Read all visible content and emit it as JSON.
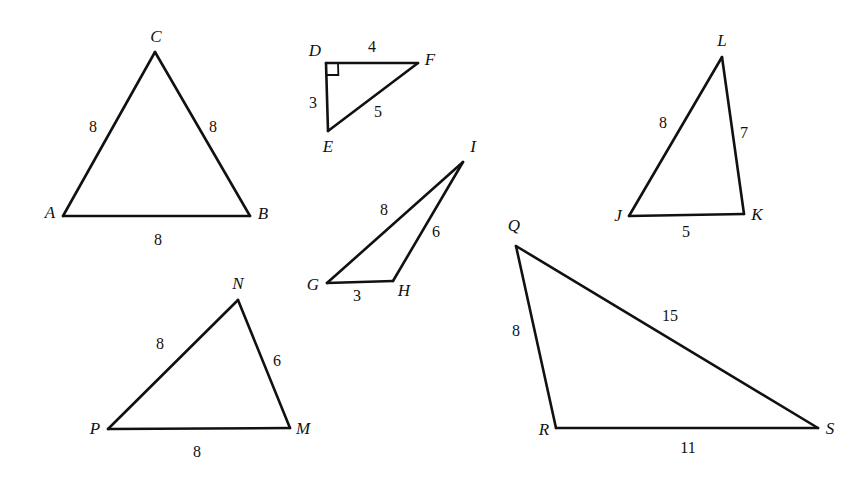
{
  "figure": {
    "width": 867,
    "height": 482,
    "background_color": "#ffffff",
    "line_color": "#111111"
  },
  "chart_data": {
    "type": "diagram",
    "title": "",
    "shapes": [
      {
        "id": "triangle-abc",
        "name": "Triangle ABC",
        "vertices": [
          {
            "label": "A",
            "x": 63,
            "y": 216,
            "label_x": 50,
            "label_y": 214
          },
          {
            "label": "B",
            "x": 250,
            "y": 216,
            "label_x": 263,
            "label_y": 215
          },
          {
            "label": "C",
            "x": 155,
            "y": 52,
            "label_x": 156,
            "label_y": 38
          }
        ],
        "sides": [
          {
            "from": "A",
            "to": "C",
            "value": "8",
            "label_x": 93,
            "label_y": 128
          },
          {
            "from": "C",
            "to": "B",
            "value": "8",
            "label_x": 213,
            "label_y": 128
          },
          {
            "from": "A",
            "to": "B",
            "value": "8",
            "label_x": 158,
            "label_y": 241
          }
        ],
        "right_angle_at": null
      },
      {
        "id": "triangle-def",
        "name": "Triangle DEF",
        "vertices": [
          {
            "label": "D",
            "x": 326,
            "y": 63,
            "label_x": 315,
            "label_y": 52
          },
          {
            "label": "E",
            "x": 328,
            "y": 131,
            "label_x": 328,
            "label_y": 148
          },
          {
            "label": "F",
            "x": 418,
            "y": 63,
            "label_x": 430,
            "label_y": 61
          }
        ],
        "sides": [
          {
            "from": "D",
            "to": "F",
            "value": "4",
            "label_x": 372,
            "label_y": 48
          },
          {
            "from": "D",
            "to": "E",
            "value": "3",
            "label_x": 313,
            "label_y": 104
          },
          {
            "from": "E",
            "to": "F",
            "value": "5",
            "label_x": 378,
            "label_y": 113
          }
        ],
        "right_angle_at": "D"
      },
      {
        "id": "triangle-ghi",
        "name": "Triangle GHI",
        "vertices": [
          {
            "label": "G",
            "x": 327,
            "y": 283,
            "label_x": 313,
            "label_y": 286
          },
          {
            "label": "H",
            "x": 393,
            "y": 281,
            "label_x": 404,
            "label_y": 292
          },
          {
            "label": "I",
            "x": 463,
            "y": 162,
            "label_x": 473,
            "label_y": 148
          }
        ],
        "sides": [
          {
            "from": "G",
            "to": "I",
            "value": "8",
            "label_x": 384,
            "label_y": 211
          },
          {
            "from": "I",
            "to": "H",
            "value": "6",
            "label_x": 436,
            "label_y": 233
          },
          {
            "from": "G",
            "to": "H",
            "value": "3",
            "label_x": 357,
            "label_y": 297
          }
        ],
        "right_angle_at": null
      },
      {
        "id": "triangle-jkl",
        "name": "Triangle JKL",
        "vertices": [
          {
            "label": "J",
            "x": 629,
            "y": 216,
            "label_x": 618,
            "label_y": 217
          },
          {
            "label": "K",
            "x": 744,
            "y": 214,
            "label_x": 757,
            "label_y": 216
          },
          {
            "label": "L",
            "x": 722,
            "y": 57,
            "label_x": 722,
            "label_y": 42
          }
        ],
        "sides": [
          {
            "from": "J",
            "to": "L",
            "value": "8",
            "label_x": 663,
            "label_y": 124
          },
          {
            "from": "L",
            "to": "K",
            "value": "7",
            "label_x": 744,
            "label_y": 134
          },
          {
            "from": "J",
            "to": "K",
            "value": "5",
            "label_x": 686,
            "label_y": 233
          }
        ],
        "right_angle_at": null
      },
      {
        "id": "triangle-mnp",
        "name": "Triangle MNP",
        "vertices": [
          {
            "label": "P",
            "x": 108,
            "y": 429,
            "label_x": 95,
            "label_y": 430
          },
          {
            "label": "M",
            "x": 290,
            "y": 428,
            "label_x": 303,
            "label_y": 430
          },
          {
            "label": "N",
            "x": 238,
            "y": 300,
            "label_x": 238,
            "label_y": 285
          }
        ],
        "sides": [
          {
            "from": "P",
            "to": "N",
            "value": "8",
            "label_x": 160,
            "label_y": 345
          },
          {
            "from": "N",
            "to": "M",
            "value": "6",
            "label_x": 277,
            "label_y": 362
          },
          {
            "from": "P",
            "to": "M",
            "value": "8",
            "label_x": 197,
            "label_y": 453
          }
        ],
        "right_angle_at": null
      },
      {
        "id": "triangle-qrs",
        "name": "Triangle QRS",
        "vertices": [
          {
            "label": "Q",
            "x": 516,
            "y": 246,
            "label_x": 514,
            "label_y": 227
          },
          {
            "label": "R",
            "x": 556,
            "y": 428,
            "label_x": 544,
            "label_y": 431
          },
          {
            "label": "S",
            "x": 818,
            "y": 428,
            "label_x": 830,
            "label_y": 430
          }
        ],
        "sides": [
          {
            "from": "Q",
            "to": "R",
            "value": "8",
            "label_x": 516,
            "label_y": 332
          },
          {
            "from": "Q",
            "to": "S",
            "value": "15",
            "label_x": 670,
            "label_y": 317
          },
          {
            "from": "R",
            "to": "S",
            "value": "11",
            "label_x": 688,
            "label_y": 449
          }
        ],
        "right_angle_at": null
      }
    ]
  }
}
